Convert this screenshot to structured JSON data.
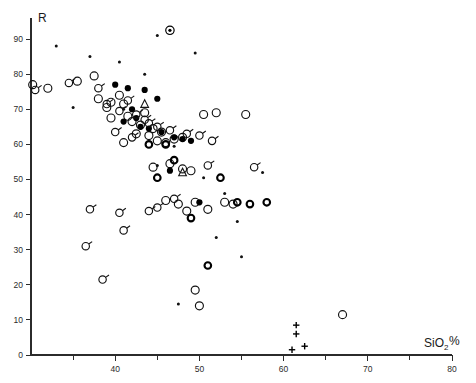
{
  "chart_data": {
    "type": "scatter",
    "title": "",
    "ylabel": "R",
    "xlabel": "SiO2%",
    "xlabel_base": "SiO",
    "xlabel_sub": "2",
    "xlabel_pct": "%",
    "xlim": [
      30,
      80
    ],
    "ylim": [
      0,
      96
    ],
    "grid": false,
    "legend": "none",
    "xticks": [
      40,
      50,
      60,
      70,
      80
    ],
    "xtick_labels": [
      "40",
      "50",
      "60",
      "70",
      "80"
    ],
    "xminor_ticks": [
      35,
      45,
      55,
      65,
      75
    ],
    "yticks": [
      0,
      10,
      20,
      30,
      40,
      50,
      60,
      70,
      80,
      90
    ],
    "ytick_labels": [
      "0",
      "10",
      "20",
      "30",
      "40",
      "50",
      "60",
      "70",
      "80",
      "90"
    ],
    "marker_kinds": {
      "open": "open-circle",
      "filled": "filled-circle",
      "dot": "small-dot",
      "tailed": "open-circle-with-tail",
      "thick": "thick-open-circle",
      "triangle": "open-triangle",
      "bullseye": "circle-with-center-dot",
      "plus": "plus-cross"
    },
    "series": [
      {
        "name": "open-circle",
        "marker": "open",
        "points": [
          [
            30.2,
            77.0
          ],
          [
            32.0,
            76.0
          ],
          [
            35.5,
            78.0
          ],
          [
            37.5,
            79.5
          ],
          [
            38.0,
            73.0
          ],
          [
            39.0,
            70.5
          ],
          [
            39.5,
            67.5
          ],
          [
            40.5,
            74.0
          ],
          [
            41.0,
            71.5
          ],
          [
            41.5,
            68.0
          ],
          [
            42.0,
            66.5
          ],
          [
            42.5,
            63.0
          ],
          [
            43.0,
            65.5
          ],
          [
            43.5,
            69.0
          ],
          [
            44.0,
            62.5
          ],
          [
            44.5,
            64.5
          ],
          [
            45.0,
            61.0
          ],
          [
            45.5,
            63.5
          ],
          [
            46.0,
            60.5
          ],
          [
            47.0,
            61.5
          ],
          [
            48.0,
            62.0
          ],
          [
            50.5,
            68.5
          ],
          [
            52.0,
            69.0
          ],
          [
            55.5,
            68.5
          ],
          [
            44.5,
            53.5
          ],
          [
            46.5,
            54.5
          ],
          [
            48.0,
            53.0
          ],
          [
            49.0,
            52.5
          ],
          [
            46.0,
            44.0
          ],
          [
            47.5,
            43.0
          ],
          [
            49.5,
            43.5
          ],
          [
            53.0,
            43.5
          ],
          [
            54.0,
            43.0
          ],
          [
            51.0,
            41.5
          ],
          [
            48.5,
            41.0
          ],
          [
            49.5,
            18.5
          ],
          [
            50.0,
            14.0
          ],
          [
            67.0,
            11.5
          ],
          [
            39.5,
            72.0
          ],
          [
            41.0,
            60.5
          ]
        ]
      },
      {
        "name": "filled-circle",
        "marker": "filled",
        "points": [
          [
            40.0,
            77.0
          ],
          [
            41.5,
            76.0
          ],
          [
            43.5,
            75.5
          ],
          [
            45.0,
            73.0
          ],
          [
            42.0,
            70.0
          ],
          [
            41.0,
            66.5
          ],
          [
            43.0,
            65.0
          ],
          [
            44.0,
            64.5
          ],
          [
            45.5,
            63.5
          ],
          [
            47.0,
            62.0
          ],
          [
            48.0,
            61.5
          ],
          [
            49.0,
            61.0
          ],
          [
            46.5,
            52.5
          ],
          [
            50.0,
            43.5
          ],
          [
            42.5,
            67.5
          ]
        ]
      },
      {
        "name": "small-dot",
        "marker": "dot",
        "points": [
          [
            33.0,
            88.0
          ],
          [
            37.0,
            85.0
          ],
          [
            40.5,
            83.5
          ],
          [
            43.5,
            80.0
          ],
          [
            45.0,
            91.0
          ],
          [
            49.5,
            86.0
          ],
          [
            35.0,
            70.5
          ],
          [
            41.0,
            70.0
          ],
          [
            47.0,
            59.5
          ],
          [
            45.0,
            54.0
          ],
          [
            50.5,
            50.5
          ],
          [
            53.0,
            46.0
          ],
          [
            54.5,
            38.0
          ],
          [
            52.0,
            33.5
          ],
          [
            55.0,
            28.0
          ],
          [
            47.5,
            14.5
          ],
          [
            57.5,
            52.0
          ]
        ]
      },
      {
        "name": "open-circle-with-tail",
        "marker": "tailed",
        "points": [
          [
            30.5,
            75.5
          ],
          [
            34.5,
            77.5
          ],
          [
            38.0,
            76.0
          ],
          [
            39.0,
            71.5
          ],
          [
            40.5,
            69.5
          ],
          [
            41.5,
            72.5
          ],
          [
            42.5,
            68.5
          ],
          [
            43.5,
            67.0
          ],
          [
            44.0,
            66.0
          ],
          [
            45.0,
            65.0
          ],
          [
            46.5,
            64.0
          ],
          [
            48.5,
            63.0
          ],
          [
            50.0,
            62.5
          ],
          [
            51.5,
            61.0
          ],
          [
            40.0,
            63.5
          ],
          [
            42.0,
            62.0
          ],
          [
            51.0,
            54.0
          ],
          [
            56.5,
            53.5
          ],
          [
            37.0,
            41.5
          ],
          [
            40.5,
            40.5
          ],
          [
            44.0,
            41.0
          ],
          [
            45.0,
            42.0
          ],
          [
            41.0,
            35.5
          ],
          [
            38.5,
            21.5
          ],
          [
            36.5,
            31.0
          ],
          [
            47.0,
            44.5
          ]
        ]
      },
      {
        "name": "thick-open-circle",
        "marker": "thick",
        "points": [
          [
            47.0,
            55.5
          ],
          [
            52.5,
            50.5
          ],
          [
            45.0,
            50.5
          ],
          [
            54.5,
            43.5
          ],
          [
            56.0,
            43.0
          ],
          [
            58.0,
            43.5
          ],
          [
            51.0,
            25.5
          ],
          [
            49.0,
            39.0
          ],
          [
            44.0,
            60.0
          ],
          [
            46.0,
            60.0
          ]
        ]
      },
      {
        "name": "open-triangle",
        "marker": "triangle",
        "points": [
          [
            43.5,
            71.5
          ],
          [
            48.0,
            52.0
          ]
        ]
      },
      {
        "name": "circle-with-center-dot",
        "marker": "bullseye",
        "points": [
          [
            46.5,
            92.5
          ]
        ]
      },
      {
        "name": "plus-cross",
        "marker": "plus",
        "points": [
          [
            61.5,
            8.5
          ],
          [
            61.5,
            6.0
          ],
          [
            61.0,
            1.5
          ],
          [
            62.5,
            2.5
          ]
        ]
      }
    ]
  },
  "axes_geometry": {
    "plot_left_px": 31,
    "plot_bottom_px": 355,
    "plot_right_px": 452,
    "plot_top_px": 18
  }
}
